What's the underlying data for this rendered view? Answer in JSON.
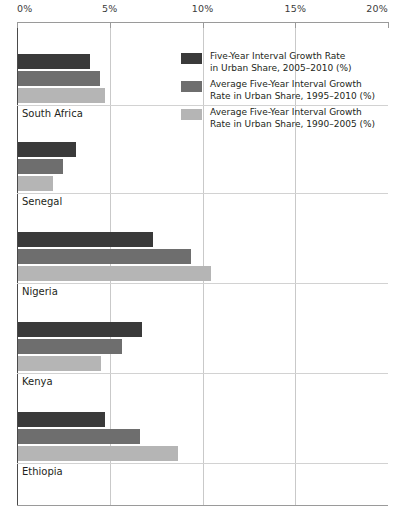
{
  "chart_data": {
    "type": "bar",
    "orientation": "horizontal",
    "title": "",
    "xlabel": "",
    "ylabel": "",
    "xlim": [
      0,
      20
    ],
    "xticks": [
      0,
      5,
      10,
      15,
      20
    ],
    "xtick_labels": [
      "0%",
      "5%",
      "10%",
      "15%",
      "20%"
    ],
    "grid": true,
    "legend_position": "inside-top-right",
    "categories": [
      "South Africa",
      "Senegal",
      "Nigeria",
      "Kenya",
      "Ethiopia"
    ],
    "series": [
      {
        "name": "Five-Year Interval Growth Rate\nin Urban Share, 2005–2010 (%)",
        "color": "#3a3a3a",
        "values": [
          3.9,
          3.1,
          7.3,
          6.7,
          4.7
        ]
      },
      {
        "name": "Average Five-Year Interval Growth\nRate in Urban Share, 1995–2010 (%)",
        "color": "#6e6e6e",
        "values": [
          4.4,
          2.4,
          9.3,
          5.6,
          6.6
        ]
      },
      {
        "name": "Average Five-Year Interval Growth\nRate in Urban Share, 1990–2005 (%)",
        "color": "#b5b5b5",
        "values": [
          4.7,
          1.9,
          10.4,
          4.5,
          8.6
        ]
      }
    ]
  },
  "axis": {
    "ticks": [
      {
        "label": "0%",
        "value": 0
      },
      {
        "label": "5%",
        "value": 5
      },
      {
        "label": "10%",
        "value": 10
      },
      {
        "label": "15%",
        "value": 15
      },
      {
        "label": "20%",
        "value": 20
      }
    ]
  },
  "legend": {
    "items": [
      {
        "label": "Five-Year Interval Growth Rate\nin Urban Share, 2005–2010 (%)",
        "color": "#3a3a3a"
      },
      {
        "label": "Average Five-Year Interval Growth\nRate in Urban Share, 1995–2010 (%)",
        "color": "#6e6e6e"
      },
      {
        "label": "Average Five-Year Interval Growth\nRate in Urban Share, 1990–2005 (%)",
        "color": "#b5b5b5"
      }
    ]
  }
}
